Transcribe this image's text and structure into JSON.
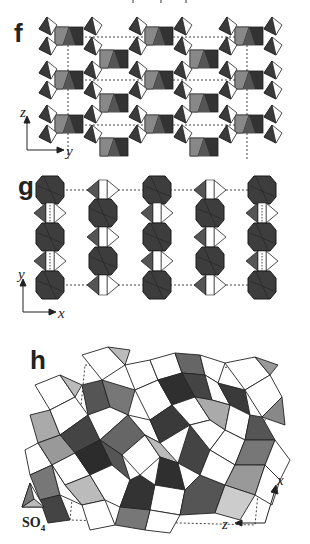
{
  "figure": {
    "top_fragment": "",
    "panels": [
      {
        "id": "f",
        "label": "f",
        "axes": {
          "vertical": "z",
          "horizontal": "y"
        },
        "description": "Layered framework of octahedra chains with corner-sharing tetrahedra, unit cell dashed"
      },
      {
        "id": "g",
        "label": "g",
        "axes": {
          "vertical": "y",
          "horizontal": "x"
        },
        "description": "Columns of dark octahedra alternating with tetrahedra pairs, unit cell dashed"
      },
      {
        "id": "h",
        "label": "h",
        "axes": {
          "vertical": "x",
          "horizontal": "z"
        },
        "annotation": "SO",
        "annotation_subscript": "4",
        "description": "Dense polyhedral framework with SO4 tetrahedra, unit cell dashed"
      }
    ],
    "colors": {
      "dark_polyhedron": "#3a3a3a",
      "mid_polyhedron": "#7a7a7a",
      "light_polyhedron": "#bdbdbd",
      "white_face": "#ffffff",
      "outline": "#222222",
      "cell_line": "#555555"
    }
  }
}
